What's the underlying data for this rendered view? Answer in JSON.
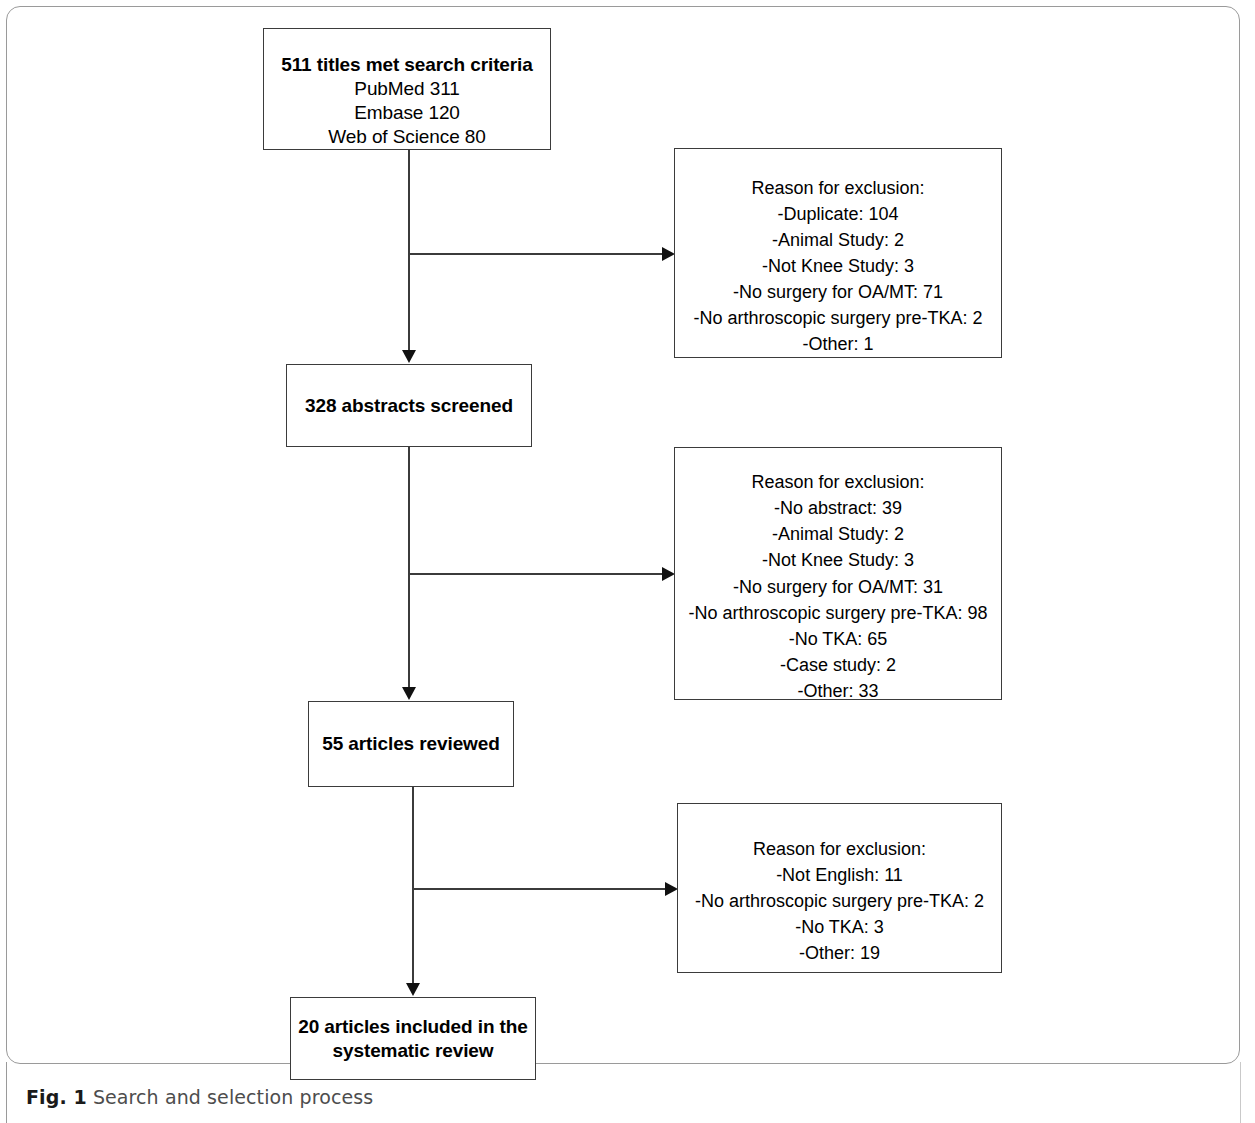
{
  "figure": {
    "caption_label": "Fig. 1",
    "caption_text": "Search and selection process"
  },
  "flowchart": {
    "type": "prisma-flow",
    "stages": [
      {
        "id": "titles",
        "headline": "511 titles met search criteria",
        "details": "PubMed 311\nEmbase 120\nWeb of Science 80",
        "count": 511
      },
      {
        "id": "abstracts",
        "headline": "328 abstracts screened",
        "count": 328
      },
      {
        "id": "articles",
        "headline": "55 articles reviewed",
        "count": 55
      },
      {
        "id": "included",
        "headline": "20 articles included in the\nsystematic review",
        "count": 20
      }
    ],
    "exclusions": [
      {
        "id": "exclusion-1",
        "title": "Reason for exclusion:",
        "reasons": "-Duplicate: 104\n-Animal Study: 2\n-Not Knee Study: 3\n-No surgery for OA/MT: 71\n-No arthroscopic surgery pre-TKA: 2\n-Other: 1",
        "items": [
          {
            "label": "Duplicate",
            "value": 104
          },
          {
            "label": "Animal Study",
            "value": 2
          },
          {
            "label": "Not Knee Study",
            "value": 3
          },
          {
            "label": "No surgery for OA/MT",
            "value": 71
          },
          {
            "label": "No arthroscopic surgery pre-TKA",
            "value": 2
          },
          {
            "label": "Other",
            "value": 1
          }
        ]
      },
      {
        "id": "exclusion-2",
        "title": "Reason for exclusion:",
        "reasons": "-No abstract: 39\n-Animal Study: 2\n-Not Knee Study: 3\n-No surgery for OA/MT: 31\n-No arthroscopic surgery pre-TKA: 98\n-No TKA: 65\n-Case study: 2\n-Other: 33",
        "items": [
          {
            "label": "No abstract",
            "value": 39
          },
          {
            "label": "Animal Study",
            "value": 2
          },
          {
            "label": "Not Knee Study",
            "value": 3
          },
          {
            "label": "No surgery for OA/MT",
            "value": 31
          },
          {
            "label": "No arthroscopic surgery pre-TKA",
            "value": 98
          },
          {
            "label": "No TKA",
            "value": 65
          },
          {
            "label": "Case study",
            "value": 2
          },
          {
            "label": "Other",
            "value": 33
          }
        ]
      },
      {
        "id": "exclusion-3",
        "title": "Reason for exclusion:",
        "reasons": "-Not English: 11\n-No arthroscopic surgery pre-TKA: 2\n-No TKA: 3\n-Other: 19",
        "items": [
          {
            "label": "Not English",
            "value": 11
          },
          {
            "label": "No arthroscopic surgery pre-TKA",
            "value": 2
          },
          {
            "label": "No TKA",
            "value": 3
          },
          {
            "label": "Other",
            "value": 19
          }
        ]
      }
    ],
    "colors": {
      "box_border": "#3b3b3b",
      "connector": "#3b3b3b",
      "arrow": "#111111",
      "frame": "#9a9a9a",
      "text": "#000000",
      "caption_text": "#4d4d4d"
    }
  }
}
